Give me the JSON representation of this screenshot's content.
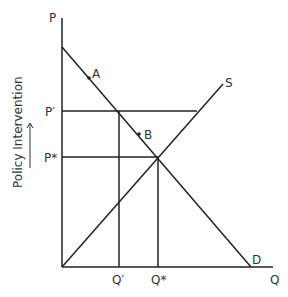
{
  "diagram": {
    "axis_y_label": "P",
    "axis_x_label": "Q",
    "side_label": "Policy Intervention",
    "price_labels": {
      "p_prime": "P′",
      "p_star": "P*"
    },
    "quantity_labels": {
      "q_prime": "Q′",
      "q_star": "Q*"
    },
    "curve_labels": {
      "supply": "S",
      "demand": "D"
    },
    "point_labels": {
      "a": "A",
      "b": "B"
    },
    "colors": {
      "line": "#222222",
      "text": "#333333"
    }
  }
}
